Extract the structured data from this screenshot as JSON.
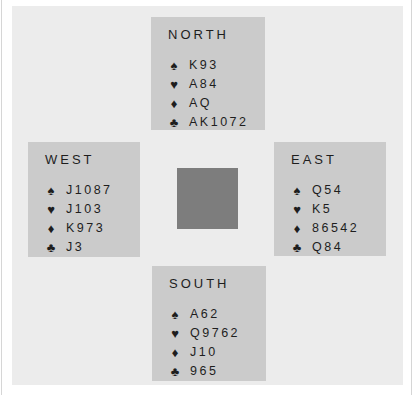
{
  "layout": {
    "background": "#ffffff",
    "panel_color": "#ececec",
    "hand_box_color": "#cbcbcb",
    "table_center_color": "#7d7d7d",
    "text_color": "#1e1e1e"
  },
  "suit_icons": {
    "spades": "♠",
    "hearts": "♥",
    "diamonds": "♦",
    "clubs": "♣"
  },
  "hands": {
    "north": {
      "title": "NORTH",
      "spades": "K93",
      "hearts": "A84",
      "diamonds": "AQ",
      "clubs": "AK1072"
    },
    "west": {
      "title": "WEST",
      "spades": "J1087",
      "hearts": "J103",
      "diamonds": "K973",
      "clubs": "J3"
    },
    "east": {
      "title": "EAST",
      "spades": "Q54",
      "hearts": "K5",
      "diamonds": "86542",
      "clubs": "Q84"
    },
    "south": {
      "title": "SOUTH",
      "spades": "A62",
      "hearts": "Q9762",
      "diamonds": "J10",
      "clubs": "965"
    }
  }
}
